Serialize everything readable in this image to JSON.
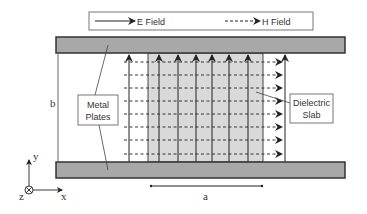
{
  "legend": {
    "e_field_label": "E Field",
    "h_field_label": "H Field"
  },
  "labels": {
    "metal_plates_line1": "Metal",
    "metal_plates_line2": "Plates",
    "dielectric_line1": "Dielectric",
    "dielectric_line2": "Slab",
    "dimension_b": "b",
    "dimension_a": "a",
    "axis_y": "y",
    "axis_x": "x",
    "axis_z": "z"
  },
  "colors": {
    "plate_fill": "#a8a8a8",
    "plate_stroke": "#333333",
    "slab_fill": "#d9d9d9",
    "line": "#222222"
  }
}
